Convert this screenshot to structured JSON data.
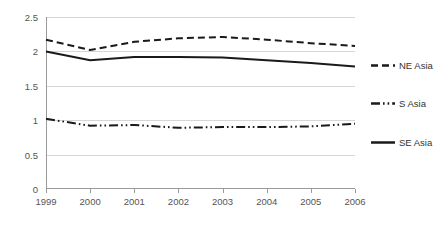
{
  "chart_data": {
    "type": "line",
    "title": "",
    "xlabel": "",
    "ylabel": "",
    "categories": [
      "1999",
      "2000",
      "2001",
      "2002",
      "2003",
      "2004",
      "2005",
      "2006"
    ],
    "x": [
      1999,
      2000,
      2001,
      2002,
      2003,
      2004,
      2005,
      2006
    ],
    "ylim": [
      0,
      2.5
    ],
    "yticks": [
      "0",
      "0.5",
      "1",
      "1.5",
      "2",
      "2.5"
    ],
    "ytick_values": [
      0,
      0.5,
      1,
      1.5,
      2,
      2.5
    ],
    "grid": "horizontal",
    "legend_position": "right",
    "series": [
      {
        "name": "NE Asia",
        "style": "dashed",
        "color": "#1a1a1a",
        "values": [
          2.17,
          2.02,
          2.14,
          2.19,
          2.21,
          2.17,
          2.12,
          2.08
        ]
      },
      {
        "name": "S Asia",
        "style": "dash-dot-dot",
        "color": "#1a1a1a",
        "values": [
          1.02,
          0.92,
          0.93,
          0.89,
          0.9,
          0.9,
          0.91,
          0.95
        ]
      },
      {
        "name": "SE Asia",
        "style": "solid",
        "color": "#1a1a1a",
        "values": [
          2.0,
          1.87,
          1.92,
          1.92,
          1.91,
          1.87,
          1.83,
          1.78
        ]
      }
    ]
  }
}
